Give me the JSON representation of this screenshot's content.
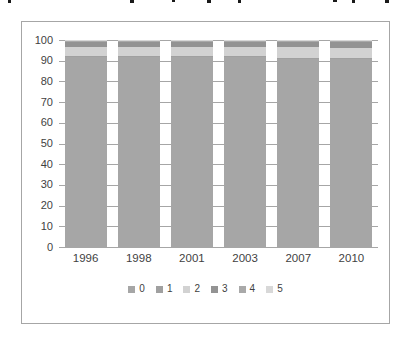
{
  "chart_data": {
    "type": "bar",
    "stacked": true,
    "percent_stacked": true,
    "title": "",
    "xlabel": "",
    "ylabel": "",
    "categories": [
      "1996",
      "1998",
      "2001",
      "2003",
      "2007",
      "2010"
    ],
    "series": [
      {
        "name": "0",
        "color": "#a6a6a6",
        "values": [
          92,
          92,
          92,
          92,
          91,
          91
        ]
      },
      {
        "name": "1",
        "color": "#a0a0a0",
        "values": [
          0.5,
          0.5,
          0.5,
          0.5,
          0.5,
          0.5
        ]
      },
      {
        "name": "2",
        "color": "#d2d2d2",
        "values": [
          4,
          4,
          4,
          4,
          5,
          4.5
        ]
      },
      {
        "name": "3",
        "color": "#939393",
        "values": [
          2.5,
          2.5,
          2.5,
          2.5,
          2.5,
          3
        ]
      },
      {
        "name": "4",
        "color": "#a9a9a9",
        "values": [
          0.7,
          0.7,
          0.7,
          0.7,
          0.7,
          0.7
        ]
      },
      {
        "name": "5",
        "color": "#d8d8d8",
        "values": [
          0.3,
          0.3,
          0.3,
          0.3,
          0.3,
          0.3
        ]
      }
    ],
    "ylim": [
      0,
      100
    ],
    "yticks": [
      0,
      10,
      20,
      30,
      40,
      50,
      60,
      70,
      80,
      90,
      100
    ],
    "grid": true,
    "legend_position": "bottom",
    "legend_labels": [
      "0",
      "1",
      "2",
      "3",
      "4",
      "5"
    ]
  },
  "frame": {
    "border_color": "#a6a6a6",
    "gridline_color": "#a6a6a6",
    "text_color": "#3f3f3f"
  },
  "cropped_text_marks": {
    "xs": [
      8,
      130,
      172,
      207,
      238,
      333,
      352,
      385
    ]
  }
}
